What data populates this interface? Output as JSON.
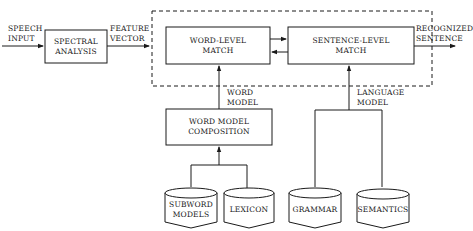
{
  "diagram": {
    "input_label": [
      "SPEECH",
      "INPUT"
    ],
    "spectral_analysis": [
      "SPECTRAL",
      "ANALYSIS"
    ],
    "feature_vector_label": [
      "FEATURE",
      "VECTOR"
    ],
    "word_level_match": [
      "WORD-LEVEL",
      "MATCH"
    ],
    "sentence_level_match": [
      "SENTENCE-LEVEL",
      "MATCH"
    ],
    "output_label": [
      "RECOGNIZED",
      "SENTENCE"
    ],
    "word_model_label": [
      "WORD",
      "MODEL"
    ],
    "language_model_label": [
      "LANGUAGE",
      "MODEL"
    ],
    "word_model_composition": [
      "WORD MODEL",
      "COMPOSITION"
    ],
    "databases": {
      "subword_models": [
        "SUBWORD",
        "MODELS"
      ],
      "lexicon": "LEXICON",
      "grammar": "GRAMMAR",
      "semantics": "SEMANTICS"
    },
    "colors": {
      "line": "#1a1a1a",
      "background": "#ffffff"
    }
  }
}
